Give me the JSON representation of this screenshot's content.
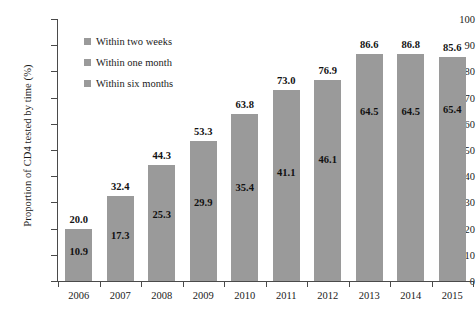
{
  "chart_data": {
    "type": "bar",
    "title": "",
    "xlabel": "",
    "ylabel": "Proportion of CD4 tested by time (%)",
    "ylim": [
      0,
      100
    ],
    "ytick_labels": [
      "100",
      "90",
      "80",
      "70",
      "60",
      "50",
      "40",
      "30",
      "20",
      "10",
      "0"
    ],
    "ytick_values": [
      100,
      90,
      80,
      70,
      60,
      50,
      40,
      30,
      20,
      10,
      0
    ],
    "grid": false,
    "legend_position": "upper-left-inside",
    "categories": [
      "2006",
      "2007",
      "2008",
      "2009",
      "2010",
      "2011",
      "2012",
      "2013",
      "2014",
      "2015"
    ],
    "series": [
      {
        "name": "Within two weeks",
        "values": [
          10.9,
          17.3,
          25.3,
          29.9,
          35.4,
          41.1,
          46.1,
          64.5,
          64.5,
          65.4
        ],
        "labels": [
          "10.9",
          "17.3",
          "25.3",
          "29.9",
          "35.4",
          "41.1",
          "46.1",
          "64.5",
          "64.5",
          "65.4"
        ]
      },
      {
        "name": "Within one month",
        "values": [
          20.0,
          32.4,
          44.3,
          53.3,
          63.8,
          73.0,
          76.9,
          86.6,
          86.8,
          85.6
        ],
        "labels": [
          "20.0",
          "32.4",
          "44.3",
          "53.3",
          "63.8",
          "73.0",
          "76.9",
          "86.6",
          "86.8",
          "85.6"
        ]
      },
      {
        "name": "Within six months",
        "values": [
          20.0,
          32.4,
          44.3,
          53.3,
          63.8,
          73.0,
          76.9,
          86.6,
          86.8,
          85.6
        ],
        "labels": [
          "20.0",
          "32.4",
          "44.3",
          "53.3",
          "63.8",
          "73.0",
          "76.9",
          "86.6",
          "86.8",
          "85.6"
        ]
      }
    ],
    "bar_color": "#9a9a9a",
    "bar_heights": [
      20.0,
      32.4,
      44.3,
      53.3,
      63.8,
      73.0,
      76.9,
      86.6,
      86.8,
      85.6
    ]
  },
  "legend": {
    "items": [
      {
        "label": "Within two weeks",
        "color": "#9a9a9a"
      },
      {
        "label": "Within one month",
        "color": "#9a9a9a"
      },
      {
        "label": "Within six months",
        "color": "#9a9a9a"
      }
    ]
  },
  "axes": {
    "y_title": "Proportion of CD4 tested by time (%)"
  }
}
